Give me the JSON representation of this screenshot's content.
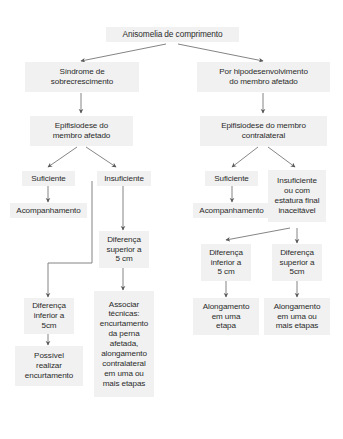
{
  "diagram": {
    "title": "Anisomelia de comprimento",
    "type": "flowchart",
    "orientation": "top-down",
    "language": "pt-BR",
    "colors": {
      "node_fill": "#f1f1f1",
      "node_text": "#2b2b2b",
      "edge": "#595959",
      "background": "#ffffff"
    },
    "nodes": [
      {
        "id": "root",
        "label": "Anisomelia de comprimento"
      },
      {
        "id": "sobrecresc",
        "label": "Síndrome de\nsobrecrescimento"
      },
      {
        "id": "hipodesenv",
        "label": "Por hipodesenvolvimento\ndo membro afetado"
      },
      {
        "id": "epif_afet",
        "label": "Epifisiodese do\nmembro afetado"
      },
      {
        "id": "epif_contra",
        "label": "Epifisiodese do membro\ncontralateral"
      },
      {
        "id": "suf_l",
        "label": "Suficiente"
      },
      {
        "id": "insuf_l",
        "label": "Insuficiente"
      },
      {
        "id": "acomp_l",
        "label": "Acompanhamento"
      },
      {
        "id": "dif_sup_l",
        "label": "Diferença\nsuperior a\n5 cm"
      },
      {
        "id": "dif_inf_l",
        "label": "Diferença\ninferior a\n5cm"
      },
      {
        "id": "possivel",
        "label": "Possível\nrealizar\nencurtamento"
      },
      {
        "id": "associar",
        "label": "Associar\ntécnicas:\nencurtamento\nda perna\nafetada,\nalongamento\ncontralateral\nem uma ou\nmais etapas"
      },
      {
        "id": "suf_r",
        "label": "Suficiente"
      },
      {
        "id": "insuf_r",
        "label": "Insuficiente\nou com\nestatura final\ninaceitável"
      },
      {
        "id": "acomp_r",
        "label": "Acompanhamento"
      },
      {
        "id": "dif_inf_r",
        "label": "Diferença\ninferior a\n5 cm"
      },
      {
        "id": "dif_sup_r",
        "label": "Diferença\nsuperior a\n5cm"
      },
      {
        "id": "along_uma",
        "label": "Alongamento\nem uma\netapa"
      },
      {
        "id": "along_mais",
        "label": "Alongamento\nem uma ou\nmais etapas"
      }
    ],
    "edges": [
      {
        "from": "root",
        "to": "sobrecresc"
      },
      {
        "from": "root",
        "to": "hipodesenv"
      },
      {
        "from": "sobrecresc",
        "to": "epif_afet"
      },
      {
        "from": "hipodesenv",
        "to": "epif_contra"
      },
      {
        "from": "epif_afet",
        "to": "suf_l"
      },
      {
        "from": "epif_afet",
        "to": "insuf_l"
      },
      {
        "from": "suf_l",
        "to": "acomp_l"
      },
      {
        "from": "insuf_l",
        "to": "dif_sup_l"
      },
      {
        "from": "insuf_l",
        "to": "dif_inf_l"
      },
      {
        "from": "dif_inf_l",
        "to": "possivel"
      },
      {
        "from": "dif_sup_l",
        "to": "associar"
      },
      {
        "from": "epif_contra",
        "to": "suf_r"
      },
      {
        "from": "epif_contra",
        "to": "insuf_r"
      },
      {
        "from": "suf_r",
        "to": "acomp_r"
      },
      {
        "from": "insuf_r",
        "to": "dif_inf_r"
      },
      {
        "from": "insuf_r",
        "to": "dif_sup_r"
      },
      {
        "from": "dif_inf_r",
        "to": "along_uma"
      },
      {
        "from": "dif_sup_r",
        "to": "along_mais"
      }
    ]
  }
}
